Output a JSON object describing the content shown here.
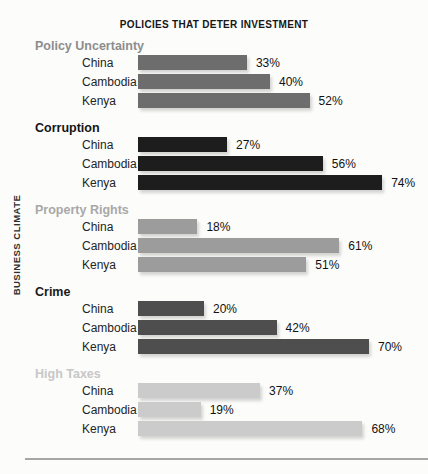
{
  "header": {
    "title": "POLICIES THAT DETER INVESTMENT"
  },
  "axis": {
    "y_label": "BUSINESS CLIMATE"
  },
  "chart_data": {
    "type": "bar",
    "orientation": "horizontal",
    "title": "POLICIES THAT DETER INVESTMENT",
    "ylabel": "BUSINESS CLIMATE",
    "value_suffix": "%",
    "xlim": [
      0,
      100
    ],
    "grid": false,
    "legend": false,
    "categories": [
      "China",
      "Cambodia",
      "Kenya"
    ],
    "groups": [
      {
        "label": "Policy Uncertainty",
        "label_color": "#8d8d8d",
        "bar_color": "#6d6d6d",
        "values": [
          33,
          40,
          52
        ]
      },
      {
        "label": "Corruption",
        "label_color": "#141414",
        "bar_color": "#1d1d1d",
        "values": [
          27,
          56,
          74
        ]
      },
      {
        "label": "Property Rights",
        "label_color": "#a8a8a8",
        "bar_color": "#9c9c9c",
        "values": [
          18,
          61,
          51
        ]
      },
      {
        "label": "Crime",
        "label_color": "#1a1a1a",
        "bar_color": "#4e4e4e",
        "values": [
          20,
          42,
          70
        ]
      },
      {
        "label": "High Taxes",
        "label_color": "#c7c7c7",
        "bar_color": "#cbcbcb",
        "values": [
          37,
          19,
          68
        ]
      }
    ]
  }
}
